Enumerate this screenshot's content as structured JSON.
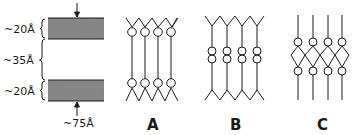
{
  "figure": {
    "dimension_labels": {
      "top_layer": "~20Å",
      "middle_layer": "~35Å",
      "bottom_layer": "~20Å",
      "total": "~75Å"
    },
    "panels": [
      {
        "id": "A",
        "label": "A"
      },
      {
        "id": "B",
        "label": "B"
      },
      {
        "id": "C",
        "label": "C"
      }
    ],
    "colors": {
      "ink": "#1a1a1a",
      "dense_layer": "#8a8a8a",
      "background": "#ffffff"
    }
  }
}
